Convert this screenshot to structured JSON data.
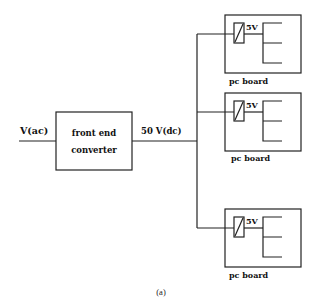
{
  "diagram": {
    "input_label": "V(ac)",
    "converter": {
      "line1": "front end",
      "line2": "converter"
    },
    "bus_label": "50 V(dc)",
    "boards": [
      {
        "label": "pc board",
        "regulator_label": "5V"
      },
      {
        "label": "pc board",
        "regulator_label": "5V"
      },
      {
        "label": "pc board",
        "regulator_label": "5V"
      }
    ],
    "caption": "(a)"
  },
  "colors": {
    "line": "#222222",
    "background": "#ffffff"
  }
}
